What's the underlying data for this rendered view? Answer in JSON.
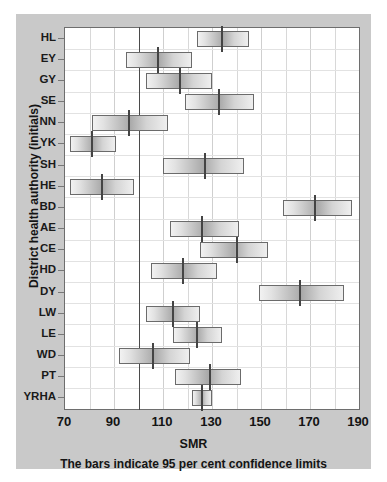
{
  "figure": {
    "xaxis_title": "SMR",
    "yaxis_title": "District health authority (initials)",
    "caption": "The bars indicate 95 per cent confidence limits",
    "background_color": "#c9c9c9",
    "plot_background_color": "#ffffff",
    "bar_fill_color": "#b4b4b4",
    "bar_border_color": "#6b6b6b",
    "reference_line_color": "#4a4a4a",
    "gridline_color": "#d8d8d8"
  },
  "chart_data": {
    "type": "bar",
    "orientation": "horizontal",
    "title": "",
    "subtitle": "",
    "xlabel": "SMR",
    "ylabel": "District health authority (initials)",
    "xlim": [
      70,
      190
    ],
    "xticks": [
      70,
      90,
      110,
      130,
      150,
      170,
      190
    ],
    "xticklabels": [
      "70",
      "90",
      "110",
      "130",
      "150",
      "170",
      "190"
    ],
    "minor_gridlines": [
      80,
      100,
      120,
      140,
      160,
      180
    ],
    "grid": true,
    "legend": null,
    "reference_line": 100,
    "annotation": "The bars indicate 95 per cent confidence limits",
    "categories": [
      "HL",
      "EY",
      "GY",
      "SE",
      "NN",
      "YK",
      "SH",
      "HE",
      "BD",
      "AE",
      "CE",
      "HD",
      "DY",
      "LW",
      "LE",
      "WD",
      "PT",
      "YRHA"
    ],
    "series": [
      {
        "name": "SMR point estimate",
        "values": [
          134,
          108,
          117,
          133,
          96,
          81,
          127,
          85,
          172,
          126,
          140,
          118,
          166,
          114,
          124,
          106,
          129,
          126
        ]
      },
      {
        "name": "95% CI lower",
        "values": [
          124,
          95,
          103,
          119,
          81,
          72,
          110,
          72,
          159,
          113,
          125,
          105,
          149,
          103,
          114,
          92,
          115,
          122
        ]
      },
      {
        "name": "95% CI upper",
        "values": [
          145,
          122,
          130,
          147,
          112,
          91,
          143,
          98,
          187,
          141,
          153,
          132,
          184,
          125,
          134,
          121,
          142,
          130
        ]
      }
    ]
  }
}
